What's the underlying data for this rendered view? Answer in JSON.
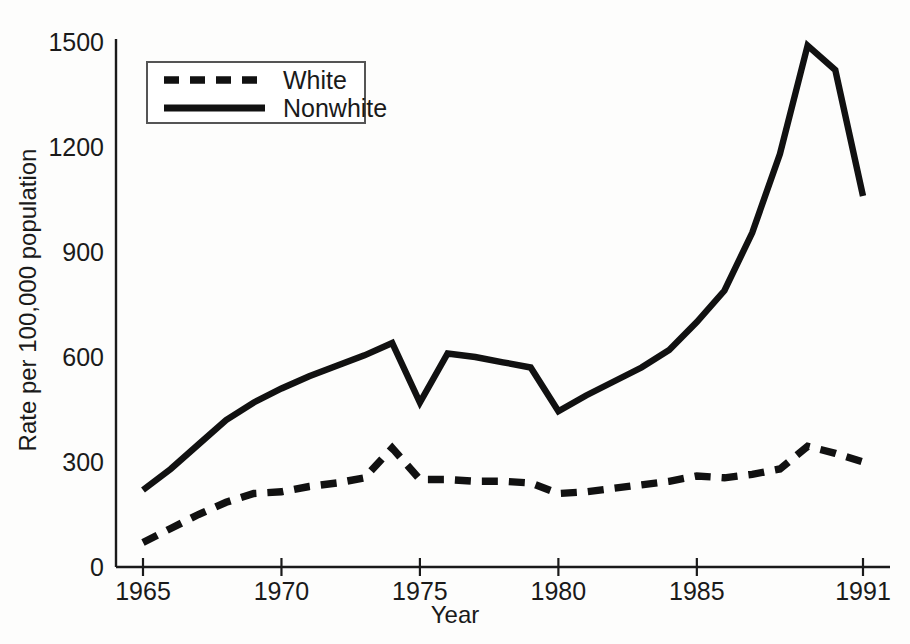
{
  "chart_data": {
    "type": "line",
    "title": "",
    "xlabel": "Year",
    "ylabel": "Rate per 100,000 population",
    "xlim": [
      1965,
      1991
    ],
    "ylim": [
      0,
      1500
    ],
    "xticks": [
      1965,
      1970,
      1975,
      1980,
      1985,
      1991
    ],
    "xticklabels": [
      "1965",
      "1970",
      "1975",
      "1980",
      "1985",
      "1991"
    ],
    "yticks": [
      0,
      300,
      600,
      900,
      1200,
      1500
    ],
    "yticklabels": [
      "0",
      "300",
      "600",
      "900",
      "1200",
      "1500"
    ],
    "grid": false,
    "legend_position": "upper-left-inside",
    "x": [
      1965,
      1966,
      1967,
      1968,
      1969,
      1970,
      1971,
      1972,
      1973,
      1974,
      1975,
      1976,
      1977,
      1978,
      1979,
      1980,
      1981,
      1982,
      1983,
      1984,
      1985,
      1986,
      1987,
      1988,
      1989,
      1990,
      1991
    ],
    "series": [
      {
        "name": "White",
        "style": "dashed",
        "values": [
          70,
          110,
          150,
          185,
          210,
          215,
          230,
          240,
          255,
          340,
          250,
          250,
          245,
          245,
          240,
          210,
          215,
          225,
          235,
          245,
          260,
          255,
          265,
          280,
          345,
          325,
          300
        ]
      },
      {
        "name": "Nonwhite",
        "style": "solid",
        "values": [
          220,
          280,
          350,
          420,
          470,
          510,
          545,
          575,
          605,
          640,
          470,
          610,
          600,
          585,
          570,
          445,
          490,
          530,
          570,
          620,
          700,
          790,
          955,
          1180,
          1490,
          1420,
          1060
        ]
      }
    ]
  },
  "legend": {
    "entries": [
      {
        "label": "White",
        "style": "dashed"
      },
      {
        "label": "Nonwhite",
        "style": "solid"
      }
    ]
  }
}
